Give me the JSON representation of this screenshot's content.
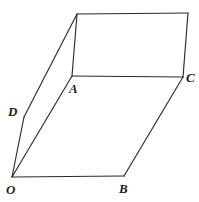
{
  "figure": {
    "type": "geometry-line-drawing",
    "canvas": {
      "width": 199,
      "height": 202,
      "background": "#ffffff"
    },
    "stroke": {
      "color": "#2b2b2b",
      "width": 1.15
    },
    "label_color": "#1d1d1d",
    "points": {
      "E": {
        "name": "top-left-corner",
        "x": 77,
        "y": 14,
        "labeled": false
      },
      "F": {
        "name": "top-right-corner",
        "x": 188,
        "y": 13,
        "labeled": false
      },
      "A": {
        "name": "A",
        "x": 72,
        "y": 76,
        "labeled": true
      },
      "C": {
        "name": "C",
        "x": 183,
        "y": 77,
        "labeled": true
      },
      "D": {
        "name": "D",
        "x": 24,
        "y": 117,
        "labeled": true
      },
      "O": {
        "name": "O",
        "x": 12,
        "y": 177,
        "labeled": true
      },
      "B": {
        "name": "B",
        "x": 124,
        "y": 176,
        "labeled": true
      }
    },
    "edges": [
      {
        "name": "edge-top",
        "from": "E",
        "to": "F"
      },
      {
        "name": "edge-right-upper",
        "from": "F",
        "to": "C"
      },
      {
        "name": "edge-A-to-C",
        "from": "A",
        "to": "C"
      },
      {
        "name": "edge-A-to-E",
        "from": "A",
        "to": "E"
      },
      {
        "name": "edge-E-to-D",
        "from": "E",
        "to": "D"
      },
      {
        "name": "edge-D-to-O",
        "from": "D",
        "to": "O"
      },
      {
        "name": "edge-O-to-A",
        "from": "O",
        "to": "A"
      },
      {
        "name": "edge-O-to-B",
        "from": "O",
        "to": "B"
      },
      {
        "name": "edge-B-to-C",
        "from": "B",
        "to": "C"
      }
    ],
    "labels": [
      {
        "key": "A",
        "text": "A",
        "x": 69,
        "y": 82
      },
      {
        "key": "C",
        "text": "C",
        "x": 186,
        "y": 71
      },
      {
        "key": "D",
        "text": "D",
        "x": 8,
        "y": 105
      },
      {
        "key": "O",
        "text": "O",
        "x": 6,
        "y": 183
      },
      {
        "key": "B",
        "text": "B",
        "x": 119,
        "y": 182
      }
    ]
  }
}
